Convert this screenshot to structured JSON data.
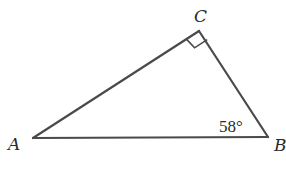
{
  "diagram": {
    "type": "right-triangle",
    "vertices": {
      "A": {
        "label": "A",
        "x": 33,
        "y": 138
      },
      "B": {
        "label": "B",
        "x": 268,
        "y": 137
      },
      "C": {
        "label": "C",
        "x": 199,
        "y": 31
      }
    },
    "right_angle_at": "C",
    "angles": [
      {
        "vertex": "B",
        "label": "58°"
      }
    ],
    "colors": {
      "line": "#4a4a4a",
      "text": "#2a2a2a",
      "background": "#ffffff"
    }
  }
}
